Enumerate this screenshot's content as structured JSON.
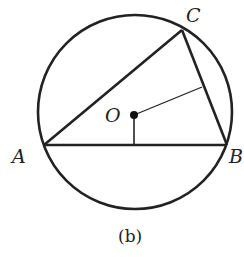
{
  "figure": {
    "caption": "(b)",
    "points": {
      "A": {
        "label": "A"
      },
      "B": {
        "label": "B"
      },
      "C": {
        "label": "C"
      },
      "O": {
        "label": "O"
      }
    }
  }
}
